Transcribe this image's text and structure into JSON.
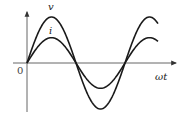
{
  "diagram": {
    "title": "",
    "axes": {
      "x_label": "ωt",
      "y_label": "",
      "origin_label": "0"
    },
    "curves": [
      {
        "name": "v",
        "label": "v",
        "description": "voltage sine wave, larger amplitude"
      },
      {
        "name": "i",
        "label": "i",
        "description": "current sine wave, smaller amplitude, in phase with v"
      }
    ],
    "colors": {
      "curve": "#1a1a1a",
      "axis": "#555555",
      "background": "#ffffff"
    }
  },
  "chart_data": {
    "type": "line",
    "title": "",
    "xlabel": "ωt",
    "ylabel": "",
    "origin_label": "0",
    "grid": false,
    "legend": "inline labels near peaks",
    "x": [
      0,
      0.5,
      1,
      1.5,
      2,
      2.5
    ],
    "x_units": "multiples of π (approx.)",
    "series": [
      {
        "name": "v",
        "values": [
          0,
          1.0,
          0,
          -1.0,
          0,
          0.95
        ],
        "relative_amplitude": 1.0
      },
      {
        "name": "i",
        "values": [
          0,
          0.55,
          0,
          -0.55,
          0,
          0.52
        ],
        "relative_amplitude": 0.55
      }
    ],
    "phase_relation": "in phase"
  }
}
